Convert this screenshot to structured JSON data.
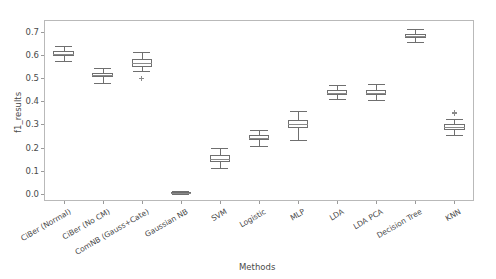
{
  "chart_data": {
    "type": "box",
    "title": "",
    "xlabel": "Methods",
    "ylabel": "f1_results",
    "ylim": [
      -0.03,
      0.75
    ],
    "yticks": [
      0.0,
      0.1,
      0.2,
      0.3,
      0.4,
      0.5,
      0.6,
      0.7
    ],
    "ytick_labels": [
      "0.0",
      "0.1",
      "0.2",
      "0.3",
      "0.4",
      "0.5",
      "0.6",
      "0.7"
    ],
    "grid": false,
    "legend": null,
    "categories": [
      "CiBer (Normal)",
      "CiBer (No CM)",
      "ComNB (Gauss+Cate)",
      "Gaussian NB",
      "SVM",
      "Logistic",
      "MLP",
      "LDA",
      "LDA PCA",
      "Decision Tree",
      "KNN"
    ],
    "boxes": [
      {
        "label": "CiBer (Normal)",
        "whisker_low": 0.572,
        "q1": 0.594,
        "median": 0.605,
        "q3": 0.615,
        "whisker_high": 0.637,
        "fliers": []
      },
      {
        "label": "CiBer (No CM)",
        "whisker_low": 0.48,
        "q1": 0.503,
        "median": 0.512,
        "q3": 0.523,
        "whisker_high": 0.545,
        "fliers": []
      },
      {
        "label": "ComNB (Gauss+Cate)",
        "whisker_low": 0.53,
        "q1": 0.548,
        "median": 0.566,
        "q3": 0.584,
        "whisker_high": 0.614,
        "fliers": [
          0.5
        ]
      },
      {
        "label": "Gaussian NB",
        "whisker_low": 0.002,
        "q1": 0.004,
        "median": 0.006,
        "q3": 0.009,
        "whisker_high": 0.013,
        "fliers": []
      },
      {
        "label": "SVM",
        "whisker_low": 0.112,
        "q1": 0.139,
        "median": 0.152,
        "q3": 0.17,
        "whisker_high": 0.2,
        "fliers": []
      },
      {
        "label": "Logistic",
        "whisker_low": 0.208,
        "q1": 0.231,
        "median": 0.241,
        "q3": 0.253,
        "whisker_high": 0.275,
        "fliers": []
      },
      {
        "label": "MLP",
        "whisker_low": 0.232,
        "q1": 0.283,
        "median": 0.303,
        "q3": 0.32,
        "whisker_high": 0.36,
        "fliers": []
      },
      {
        "label": "LDA",
        "whisker_low": 0.408,
        "q1": 0.428,
        "median": 0.437,
        "q3": 0.449,
        "whisker_high": 0.472,
        "fliers": []
      },
      {
        "label": "LDA PCA",
        "whisker_low": 0.406,
        "q1": 0.427,
        "median": 0.437,
        "q3": 0.45,
        "whisker_high": 0.476,
        "fliers": []
      },
      {
        "label": "Decision Tree",
        "whisker_low": 0.655,
        "q1": 0.673,
        "median": 0.682,
        "q3": 0.691,
        "whisker_high": 0.71,
        "fliers": []
      },
      {
        "label": "KNN",
        "whisker_low": 0.253,
        "q1": 0.275,
        "median": 0.287,
        "q3": 0.3,
        "whisker_high": 0.322,
        "fliers": [
          0.345,
          0.352
        ]
      }
    ]
  }
}
